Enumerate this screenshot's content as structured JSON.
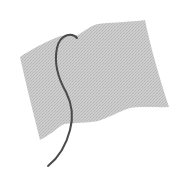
{
  "image": {
    "subject": "waving flag icon",
    "icon": "flag-icon",
    "colors": {
      "background": "#ffffff",
      "flag_fill": "#c9c9c9",
      "flag_texture": "#b8b8b8",
      "pole": "#4a4a4a"
    }
  }
}
